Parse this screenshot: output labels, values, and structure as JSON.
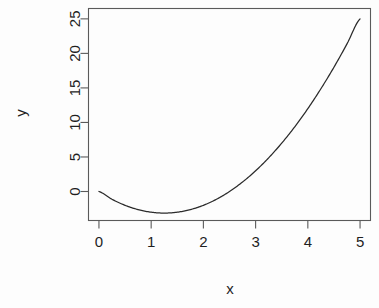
{
  "chart_data": {
    "type": "line",
    "title": "",
    "subtitle": "",
    "xlabel": "x",
    "ylabel": "y",
    "xlim": [
      -0.2,
      5.2
    ],
    "ylim": [
      -4.2,
      26.5
    ],
    "xticks": [
      0,
      1,
      2,
      3,
      4,
      5
    ],
    "xtick_labels": [
      "0",
      "1",
      "2",
      "3",
      "4",
      "5"
    ],
    "yticks": [
      0,
      5,
      10,
      15,
      20,
      25
    ],
    "ytick_labels": [
      "0",
      "5",
      "10",
      "15",
      "20",
      "25"
    ],
    "grid": false,
    "legend": null,
    "annotations": [],
    "series": [
      {
        "name": "y = 2x^2 - 5x",
        "color": "#2b2b2b",
        "x": [
          0,
          0.25,
          0.5,
          0.75,
          1,
          1.25,
          1.5,
          1.75,
          2,
          2.25,
          2.5,
          2.75,
          3,
          3.25,
          3.5,
          3.75,
          4,
          4.25,
          4.5,
          4.75,
          5
        ],
        "y": [
          0,
          -1.125,
          -2,
          -2.625,
          -3,
          -3.125,
          -3,
          -2.625,
          -2,
          -1.125,
          0,
          1.375,
          3,
          4.875,
          7,
          9.375,
          12,
          14.875,
          18,
          21.375,
          25
        ]
      }
    ]
  },
  "axes": {
    "y_title": "y",
    "x_title": "x"
  }
}
